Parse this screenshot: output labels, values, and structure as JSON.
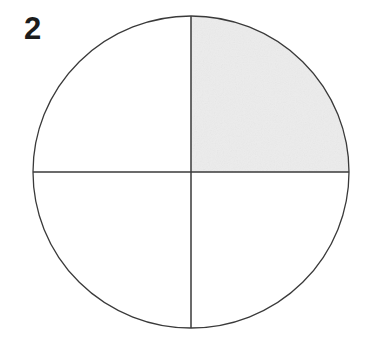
{
  "figure": {
    "label": "2",
    "kind": "fraction-circle",
    "shaded_parts": 1,
    "total_parts": 4,
    "fraction_text": "1/4"
  },
  "geometry": {
    "canvas_width": 372,
    "canvas_height": 341,
    "center_x": 191,
    "center_y": 172,
    "radius_x": 158,
    "radius_y": 156,
    "vertical_diameter_x": 191,
    "horizontal_diameter_y": 172
  },
  "colors": {
    "background": "#ffffff",
    "stroke": "#3a3a3a",
    "shade_fill": "#ececec",
    "unshaded_fill": "#ffffff",
    "label_color": "#1c1c1c"
  },
  "quadrants": [
    {
      "name": "upper-right",
      "shaded": true,
      "fill": "#ececec"
    },
    {
      "name": "upper-left",
      "shaded": false,
      "fill": "#ffffff"
    },
    {
      "name": "lower-left",
      "shaded": false,
      "fill": "#ffffff"
    },
    {
      "name": "lower-right",
      "shaded": false,
      "fill": "#ffffff"
    }
  ],
  "strokes": {
    "circle_width": 1.3,
    "divider_width": 1.5
  }
}
